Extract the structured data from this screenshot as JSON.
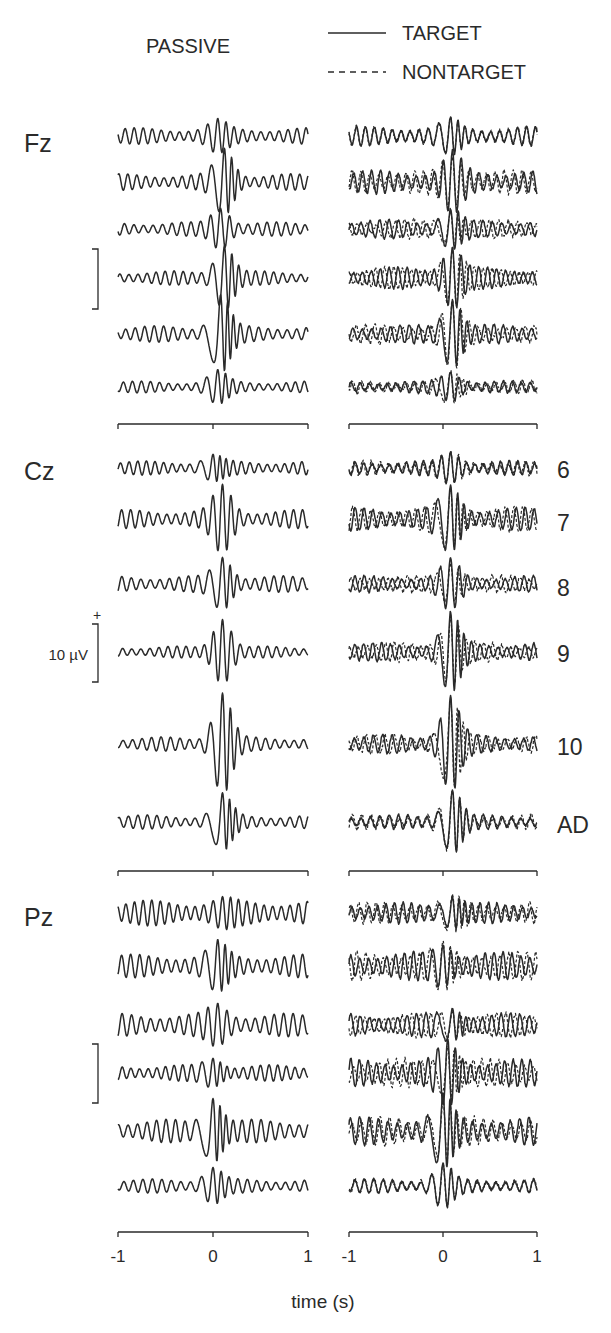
{
  "chart_data": {
    "type": "line",
    "title": "PASSIVE",
    "legend": {
      "placement": "top-right",
      "entries": [
        {
          "name": "TARGET",
          "style": "solid"
        },
        {
          "name": "NONTARGET",
          "style": "dashed"
        }
      ]
    },
    "xlabel": "time (s)",
    "xlim": [
      -1,
      1
    ],
    "xticks": [
      -1,
      0,
      1
    ],
    "xtick_labels": [
      "-1",
      "0",
      "1"
    ],
    "scale_bar": {
      "label": "10 µV",
      "value_uV": 10,
      "polarity": "+"
    },
    "color": "#2a2a2a",
    "row_labels": [
      "6",
      "7",
      "8",
      "9",
      "10",
      "AD"
    ],
    "columns": [
      {
        "name": "passive",
        "label": "PASSIVE",
        "series": [
          "TARGET"
        ]
      },
      {
        "name": "active",
        "label": "",
        "series": [
          "TARGET",
          "NONTARGET"
        ]
      }
    ],
    "panels": [
      {
        "electrode": "Fz",
        "rows": [
          {
            "group": "6",
            "passive": {
              "peak_uV": 3.0,
              "peak_time_s": 0.05,
              "bg_uV": 1.4,
              "freq_hz": 10.5
            },
            "active": {
              "peak_uV": 3.2,
              "peak_time_s": 0.08,
              "bg_uV": 1.6,
              "freq_hz": 10.5
            }
          },
          {
            "group": "7",
            "passive": {
              "peak_uV": 6.0,
              "peak_time_s": 0.12,
              "bg_uV": 1.4,
              "freq_hz": 10.5
            },
            "active": {
              "peak_uV": 5.5,
              "peak_time_s": 0.1,
              "bg_uV": 2.0,
              "freq_hz": 10.5
            }
          },
          {
            "group": "8",
            "passive": {
              "peak_uV": 4.0,
              "peak_time_s": 0.08,
              "bg_uV": 1.2,
              "freq_hz": 10.0
            },
            "active": {
              "peak_uV": 3.8,
              "peak_time_s": 0.08,
              "bg_uV": 1.6,
              "freq_hz": 10.0
            }
          },
          {
            "group": "9",
            "passive": {
              "peak_uV": 6.0,
              "peak_time_s": 0.12,
              "bg_uV": 1.2,
              "freq_hz": 10.5
            },
            "active": {
              "peak_uV": 6.0,
              "peak_time_s": 0.1,
              "bg_uV": 1.8,
              "freq_hz": 10.5
            }
          },
          {
            "group": "10",
            "passive": {
              "peak_uV": 7.0,
              "peak_time_s": 0.08,
              "bg_uV": 1.4,
              "freq_hz": 10.0
            },
            "active": {
              "peak_uV": 6.5,
              "peak_time_s": 0.1,
              "bg_uV": 1.6,
              "freq_hz": 10.0
            }
          },
          {
            "group": "AD",
            "passive": {
              "peak_uV": 3.0,
              "peak_time_s": 0.05,
              "bg_uV": 1.0,
              "freq_hz": 10.5
            },
            "active": {
              "peak_uV": 3.0,
              "peak_time_s": 0.08,
              "bg_uV": 1.0,
              "freq_hz": 10.5
            }
          }
        ]
      },
      {
        "electrode": "Cz",
        "rows": [
          {
            "group": "6",
            "passive": {
              "peak_uV": 2.5,
              "peak_time_s": 0.0,
              "bg_uV": 1.2,
              "freq_hz": 11.0
            },
            "active": {
              "peak_uV": 3.0,
              "peak_time_s": 0.08,
              "bg_uV": 1.2,
              "freq_hz": 11.0
            }
          },
          {
            "group": "7",
            "passive": {
              "peak_uV": 6.0,
              "peak_time_s": 0.1,
              "bg_uV": 1.6,
              "freq_hz": 10.5
            },
            "active": {
              "peak_uV": 6.0,
              "peak_time_s": 0.08,
              "bg_uV": 2.0,
              "freq_hz": 10.5
            }
          },
          {
            "group": "8",
            "passive": {
              "peak_uV": 5.0,
              "peak_time_s": 0.1,
              "bg_uV": 1.4,
              "freq_hz": 10.0
            },
            "active": {
              "peak_uV": 4.5,
              "peak_time_s": 0.08,
              "bg_uV": 1.4,
              "freq_hz": 10.0
            }
          },
          {
            "group": "9",
            "passive": {
              "peak_uV": 6.0,
              "peak_time_s": 0.1,
              "bg_uV": 1.0,
              "freq_hz": 10.5
            },
            "active": {
              "peak_uV": 7.0,
              "peak_time_s": 0.08,
              "bg_uV": 1.6,
              "freq_hz": 10.5
            }
          },
          {
            "group": "10",
            "passive": {
              "peak_uV": 9.0,
              "peak_time_s": 0.1,
              "bg_uV": 1.2,
              "freq_hz": 10.0
            },
            "active": {
              "peak_uV": 8.5,
              "peak_time_s": 0.08,
              "bg_uV": 1.6,
              "freq_hz": 10.0
            }
          },
          {
            "group": "AD",
            "passive": {
              "peak_uV": 5.0,
              "peak_time_s": 0.1,
              "bg_uV": 1.2,
              "freq_hz": 10.0
            },
            "active": {
              "peak_uV": 6.0,
              "peak_time_s": 0.1,
              "bg_uV": 1.2,
              "freq_hz": 10.0
            }
          }
        ]
      },
      {
        "electrode": "Pz",
        "rows": [
          {
            "group": "6",
            "passive": {
              "peak_uV": 3.0,
              "peak_time_s": 0.1,
              "bg_uV": 2.2,
              "freq_hz": 11.0
            },
            "active": {
              "peak_uV": 3.5,
              "peak_time_s": 0.1,
              "bg_uV": 1.8,
              "freq_hz": 11.0
            }
          },
          {
            "group": "7",
            "passive": {
              "peak_uV": 4.5,
              "peak_time_s": 0.05,
              "bg_uV": 2.0,
              "freq_hz": 10.5
            },
            "active": {
              "peak_uV": 4.5,
              "peak_time_s": 0.0,
              "bg_uV": 2.4,
              "freq_hz": 10.5
            }
          },
          {
            "group": "8",
            "passive": {
              "peak_uV": 4.0,
              "peak_time_s": 0.05,
              "bg_uV": 2.0,
              "freq_hz": 10.0
            },
            "active": {
              "peak_uV": 3.5,
              "peak_time_s": 0.1,
              "bg_uV": 2.0,
              "freq_hz": 10.0
            }
          },
          {
            "group": "9",
            "passive": {
              "peak_uV": 3.0,
              "peak_time_s": 0.0,
              "bg_uV": 1.4,
              "freq_hz": 11.0
            },
            "active": {
              "peak_uV": 6.0,
              "peak_time_s": 0.05,
              "bg_uV": 2.4,
              "freq_hz": 11.0
            }
          },
          {
            "group": "10",
            "passive": {
              "peak_uV": 6.5,
              "peak_time_s": 0.0,
              "bg_uV": 2.0,
              "freq_hz": 10.0
            },
            "active": {
              "peak_uV": 6.5,
              "peak_time_s": 0.0,
              "bg_uV": 2.4,
              "freq_hz": 10.0
            }
          },
          {
            "group": "AD",
            "passive": {
              "peak_uV": 3.5,
              "peak_time_s": 0.0,
              "bg_uV": 1.2,
              "freq_hz": 10.0
            },
            "active": {
              "peak_uV": 4.0,
              "peak_time_s": 0.0,
              "bg_uV": 1.2,
              "freq_hz": 10.0
            }
          }
        ]
      }
    ]
  }
}
